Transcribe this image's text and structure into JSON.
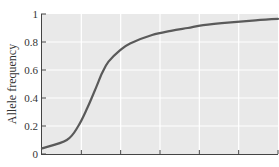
{
  "chart_data": {
    "type": "line",
    "title": "",
    "xlabel": "",
    "ylabel": "Allele frequency",
    "ylim": [
      0,
      1
    ],
    "yticks": [
      0,
      0.2,
      0.4,
      0.6,
      0.8,
      1
    ],
    "ytick_labels": [
      "0",
      "0.2",
      "0.4",
      "0.6",
      "0.8",
      "1"
    ],
    "xticks_count": 6,
    "xtick_labels": [],
    "grid": true,
    "legend": null,
    "series": [
      {
        "name": "Allele frequency",
        "x": [
          0,
          0.1,
          0.2,
          0.3,
          0.4,
          0.5,
          0.6,
          0.8,
          1.0,
          1.5,
          2.0,
          2.5,
          3.0,
          4.0,
          5.0,
          6.0
        ],
        "values": [
          0.04,
          0.1,
          0.2,
          0.33,
          0.46,
          0.58,
          0.66,
          0.74,
          0.79,
          0.85,
          0.88,
          0.9,
          0.92,
          0.94,
          0.955,
          0.965
        ]
      }
    ]
  },
  "colors": {
    "plot_background": "#e9e9e9",
    "gridline": "#ffffff",
    "curve": "#5a5a5a",
    "axis": "#444444"
  }
}
